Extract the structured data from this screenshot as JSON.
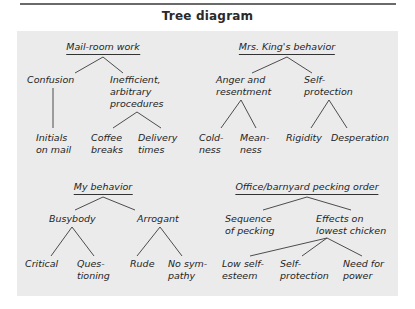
{
  "title": "Tree diagram",
  "trees": [
    {
      "root": "Mail-room work",
      "children": [
        {
          "label": [
            "Confusion"
          ],
          "children": [
            {
              "label": [
                "Initials",
                "on mail"
              ]
            }
          ]
        },
        {
          "label": [
            "Inefficient,",
            "arbitrary",
            "procedures"
          ],
          "children": [
            {
              "label": [
                "Coffee",
                "breaks"
              ]
            },
            {
              "label": [
                "Delivery",
                "times"
              ]
            }
          ]
        }
      ]
    },
    {
      "root": "Mrs. King's behavior",
      "children": [
        {
          "label": [
            "Anger and",
            "resentment"
          ],
          "children": [
            {
              "label": [
                "Cold-",
                "ness"
              ]
            },
            {
              "label": [
                "Mean-",
                "ness"
              ]
            }
          ]
        },
        {
          "label": [
            "Self-",
            "protection"
          ],
          "children": [
            {
              "label": [
                "Rigidity"
              ]
            },
            {
              "label": [
                "Desperation"
              ]
            }
          ]
        }
      ]
    },
    {
      "root": "My behavior",
      "children": [
        {
          "label": [
            "Busybody"
          ],
          "children": [
            {
              "label": [
                "Critical"
              ]
            },
            {
              "label": [
                "Ques-",
                "tioning"
              ]
            }
          ]
        },
        {
          "label": [
            "Arrogant"
          ],
          "children": [
            {
              "label": [
                "Rude"
              ]
            },
            {
              "label": [
                "No sym-",
                "pathy"
              ]
            }
          ]
        }
      ]
    },
    {
      "root": "Office/barnyard pecking order",
      "children": [
        {
          "label": [
            "Sequence",
            "of pecking"
          ]
        },
        {
          "label": [
            "Effects on",
            "lowest chicken"
          ],
          "children": [
            {
              "label": [
                "Low self-",
                "esteem"
              ]
            },
            {
              "label": [
                "Self-",
                "protection"
              ]
            },
            {
              "label": [
                "Need for",
                "power"
              ]
            }
          ]
        }
      ]
    }
  ],
  "labels": {
    "t1_root": "Mail-room work",
    "t1_confusion": "Confusion",
    "t1_ineff_1": "Inefficient,",
    "t1_ineff_2": "arbitrary",
    "t1_ineff_3": "procedures",
    "t1_initials_1": "Initials",
    "t1_initials_2": "on mail",
    "t1_coffee_1": "Coffee",
    "t1_coffee_2": "breaks",
    "t1_delivery_1": "Delivery",
    "t1_delivery_2": "times",
    "t2_root": "Mrs. King's behavior",
    "t2_anger_1": "Anger and",
    "t2_anger_2": "resentment",
    "t2_self_1": "Self-",
    "t2_self_2": "protection",
    "t2_cold_1": "Cold-",
    "t2_cold_2": "ness",
    "t2_mean_1": "Mean-",
    "t2_mean_2": "ness",
    "t2_rigidity": "Rigidity",
    "t2_desperation": "Desperation",
    "t3_root": "My behavior",
    "t3_busybody": "Busybody",
    "t3_arrogant": "Arrogant",
    "t3_critical": "Critical",
    "t3_ques_1": "Ques-",
    "t3_ques_2": "tioning",
    "t3_rude": "Rude",
    "t3_nosym_1": "No sym-",
    "t3_nosym_2": "pathy",
    "t4_root": "Office/barnyard pecking order",
    "t4_seq_1": "Sequence",
    "t4_seq_2": "of pecking",
    "t4_eff_1": "Effects on",
    "t4_eff_2": "lowest chicken",
    "t4_low_1": "Low self-",
    "t4_low_2": "esteem",
    "t4_self_1": "Self-",
    "t4_self_2": "protection",
    "t4_need_1": "Need for",
    "t4_need_2": "power"
  }
}
